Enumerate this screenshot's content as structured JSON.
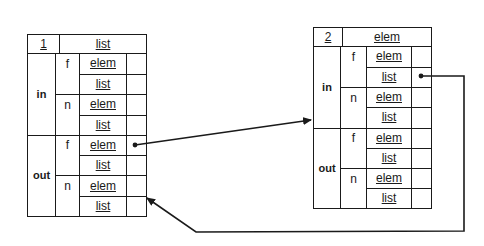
{
  "diagram": {
    "type": "linked-record-structures",
    "nodes": [
      {
        "id": "node-1",
        "header": {
          "index": "1",
          "type": "list"
        },
        "sections": [
          {
            "label": "in",
            "fields": [
              {
                "label": "f",
                "slots": [
                  "elem",
                  "list"
                ]
              },
              {
                "label": "n",
                "slots": [
                  "elem",
                  "list"
                ]
              }
            ]
          },
          {
            "label": "out",
            "fields": [
              {
                "label": "f",
                "slots": [
                  "elem",
                  "list"
                ]
              },
              {
                "label": "n",
                "slots": [
                  "elem",
                  "list"
                ]
              }
            ]
          }
        ]
      },
      {
        "id": "node-2",
        "header": {
          "index": "2",
          "type": "elem"
        },
        "sections": [
          {
            "label": "in",
            "fields": [
              {
                "label": "f",
                "slots": [
                  "elem",
                  "list"
                ]
              },
              {
                "label": "n",
                "slots": [
                  "elem",
                  "list"
                ]
              }
            ]
          },
          {
            "label": "out",
            "fields": [
              {
                "label": "f",
                "slots": [
                  "elem",
                  "list"
                ]
              },
              {
                "label": "n",
                "slots": [
                  "elem",
                  "list"
                ]
              }
            ]
          }
        ]
      }
    ],
    "edges": [
      {
        "from": "node-1.out.f.elem",
        "to": "node-2.in (top)",
        "style": "arrow"
      },
      {
        "from": "node-2.in.f.list",
        "to": "node-1.out.n.elem",
        "style": "orthogonal-then-diagonal arrow"
      }
    ],
    "colors": {
      "line": "#1a1a1a",
      "background": "#ffffff"
    }
  }
}
